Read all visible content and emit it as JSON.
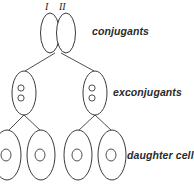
{
  "figure": {
    "background_color": "#ffffff",
    "stroke_color": "#3a3a3a",
    "text_color": "#2a2a2a",
    "width": 194,
    "height": 191
  },
  "roman_labels": [
    {
      "name": "conjugant-i",
      "text": "I"
    },
    {
      "name": "conjugant-ii",
      "text": "II"
    }
  ],
  "stage_labels": [
    {
      "name": "conjugants",
      "text": "conjugants"
    },
    {
      "name": "exconjugants",
      "text": "exconjugants"
    },
    {
      "name": "daughter-cells",
      "text": "daughter cells"
    }
  ],
  "stages": {
    "conjugants": {
      "label": "conjugants",
      "count": 2,
      "nuclei_per_cell": 0,
      "cells": [
        {
          "name": "conjugant-cell-left",
          "roman": "I",
          "cx": 50,
          "cy": 33,
          "rx": 9.5,
          "ry": 20
        },
        {
          "name": "conjugant-cell-right",
          "roman": "II",
          "cx": 66,
          "cy": 33,
          "rx": 9.5,
          "ry": 20
        }
      ]
    },
    "exconjugants": {
      "label": "exconjugants",
      "count": 2,
      "nuclei_per_cell": 2,
      "cells": [
        {
          "name": "exconjugant-cell-left",
          "cx": 24,
          "cy": 93,
          "rx": 12,
          "ry": 22
        },
        {
          "name": "exconjugant-cell-right",
          "cx": 95,
          "cy": 93,
          "rx": 12,
          "ry": 22
        }
      ]
    },
    "daughter_cells": {
      "label": "daughter cells",
      "count": 4,
      "nuclei_per_cell": 1,
      "cells": [
        {
          "name": "daughter-cell-1",
          "cx": 7,
          "cy": 155,
          "rx": 14,
          "ry": 25
        },
        {
          "name": "daughter-cell-2",
          "cx": 41,
          "cy": 155,
          "rx": 14,
          "ry": 25
        },
        {
          "name": "daughter-cell-3",
          "cx": 78,
          "cy": 155,
          "rx": 14,
          "ry": 25
        },
        {
          "name": "daughter-cell-4",
          "cx": 112,
          "cy": 155,
          "rx": 14,
          "ry": 25
        }
      ]
    }
  },
  "connectors": [
    {
      "name": "connector-conjugants-to-exconjugant-left",
      "x1": 55,
      "y1": 53,
      "x2": 24,
      "y2": 71
    },
    {
      "name": "connector-conjugants-to-exconjugant-right",
      "x1": 61,
      "y1": 53,
      "x2": 95,
      "y2": 71
    },
    {
      "name": "connector-exconjugant-left-to-daughter-1",
      "x1": 24,
      "y1": 115,
      "x2": 7,
      "y2": 130
    },
    {
      "name": "connector-exconjugant-left-to-daughter-2",
      "x1": 24,
      "y1": 115,
      "x2": 41,
      "y2": 130
    },
    {
      "name": "connector-exconjugant-right-to-daughter-3",
      "x1": 95,
      "y1": 115,
      "x2": 78,
      "y2": 130
    },
    {
      "name": "connector-exconjugant-right-to-daughter-4",
      "x1": 95,
      "y1": 115,
      "x2": 112,
      "y2": 130
    }
  ]
}
